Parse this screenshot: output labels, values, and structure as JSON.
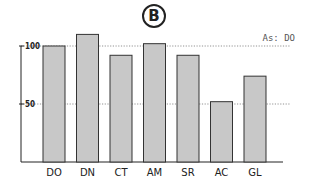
{
  "panel": {
    "label": "B"
  },
  "chart_data": {
    "type": "bar",
    "title": "",
    "panel_label": "B",
    "categories": [
      "DO",
      "DN",
      "CT",
      "AM",
      "SR",
      "AC",
      "GL"
    ],
    "values": [
      100,
      110,
      92,
      102,
      92,
      52,
      74
    ],
    "xlabel": "",
    "ylabel": "",
    "ylim": [
      0,
      115
    ],
    "yticks": [
      50,
      100
    ],
    "ytick_labels": [
      "50",
      "100"
    ],
    "reference_lines": [
      {
        "y": 100,
        "style": "dotted",
        "label": "As: DO"
      },
      {
        "y": 50,
        "style": "dotted"
      }
    ],
    "grid": false,
    "legend": null,
    "bar_color": "#c8c8c8",
    "bar_edge_color": "#333333"
  }
}
